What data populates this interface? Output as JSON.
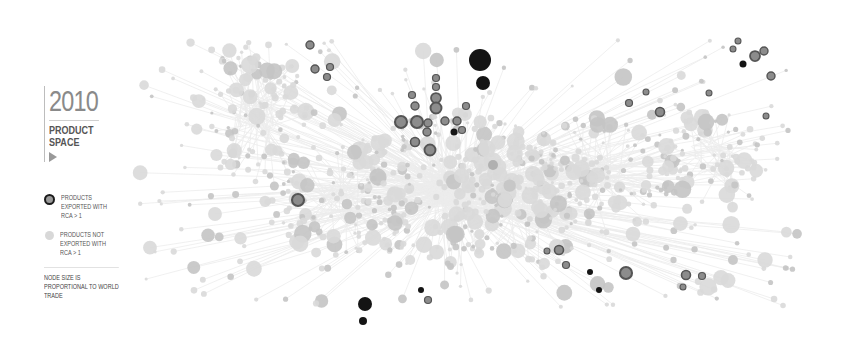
{
  "header": {
    "year": "2010",
    "title_line1": "PRODUCT",
    "title_line2": "SPACE",
    "play_icon": "play-triangle-icon"
  },
  "legend": {
    "items": [
      {
        "label": "PRODUCTS EXPORTED WITH RCA > 1",
        "swatch": "dark-ring"
      },
      {
        "label": "PRODUCTS NOT EXPORTED WITH RCA > 1",
        "swatch": "light-dot"
      }
    ],
    "note": "NODE SIZE IS PROPORTIONAL TO WORLD TRADE"
  },
  "colors": {
    "edge": "#ececec",
    "node_light": "#d9d9d9",
    "node_mid": "#c4c4c4",
    "rca_fill": "#8c8c8c",
    "rca_ring": "#555555",
    "rca_dark": "#141414"
  },
  "rca_nodes": [
    [
      480,
      60,
      11,
      "dark"
    ],
    [
      483,
      83,
      7,
      "dark"
    ],
    [
      365,
      304,
      7,
      "dark"
    ],
    [
      363,
      321,
      4,
      "dark"
    ],
    [
      298,
      200,
      6,
      "ring"
    ],
    [
      310,
      45,
      4,
      "ring"
    ],
    [
      315,
      69,
      4,
      "ring"
    ],
    [
      330,
      67,
      3.5,
      "ring"
    ],
    [
      327,
      77,
      3.5,
      "ring"
    ],
    [
      436,
      78,
      3.5,
      "ring"
    ],
    [
      436,
      87,
      3.5,
      "ring"
    ],
    [
      436,
      98,
      5,
      "ring"
    ],
    [
      436,
      108,
      5.5,
      "ring"
    ],
    [
      412,
      95,
      3.5,
      "ring"
    ],
    [
      415,
      106,
      4,
      "ring"
    ],
    [
      401,
      122,
      6,
      "ring"
    ],
    [
      417,
      122,
      6,
      "ring"
    ],
    [
      428,
      123,
      4,
      "ring"
    ],
    [
      466,
      106,
      3.5,
      "ring"
    ],
    [
      445,
      121,
      4,
      "ring"
    ],
    [
      457,
      121,
      4,
      "ring"
    ],
    [
      427,
      132,
      4,
      "ring"
    ],
    [
      454,
      132,
      3.5,
      "dark"
    ],
    [
      462,
      130,
      3.5,
      "ring"
    ],
    [
      415,
      142,
      4.5,
      "ring"
    ],
    [
      430,
      150,
      5.5,
      "ring"
    ],
    [
      493,
      165,
      5,
      "mid"
    ],
    [
      421,
      290,
      3,
      "dark"
    ],
    [
      428,
      300,
      3.5,
      "ring"
    ],
    [
      738,
      41,
      3,
      "ring"
    ],
    [
      733,
      49,
      3,
      "ring"
    ],
    [
      755,
      56,
      5,
      "ring"
    ],
    [
      764,
      51,
      4,
      "ring"
    ],
    [
      743,
      64,
      3.5,
      "dark"
    ],
    [
      771,
      76,
      4,
      "ring"
    ],
    [
      646,
      92,
      3,
      "ring"
    ],
    [
      629,
      103,
      3.5,
      "ring"
    ],
    [
      660,
      112,
      4.5,
      "ring"
    ],
    [
      709,
      93,
      3,
      "ring"
    ],
    [
      766,
      116,
      3,
      "ring"
    ],
    [
      547,
      251,
      3,
      "ring"
    ],
    [
      559,
      250,
      4.5,
      "ring"
    ],
    [
      566,
      265,
      3.5,
      "ring"
    ],
    [
      590,
      272,
      3,
      "dark"
    ],
    [
      599,
      290,
      3,
      "dark"
    ],
    [
      626,
      273,
      6,
      "ring"
    ],
    [
      686,
      275,
      4.5,
      "ring"
    ],
    [
      702,
      276,
      3.5,
      "ring"
    ],
    [
      683,
      287,
      3,
      "ring"
    ]
  ],
  "clusters": [
    [
      255,
      115,
      40,
      60
    ],
    [
      450,
      190,
      90,
      60
    ],
    [
      600,
      175,
      70,
      45
    ],
    [
      710,
      160,
      45,
      40
    ],
    [
      520,
      200,
      60,
      50
    ],
    [
      340,
      200,
      60,
      45
    ]
  ]
}
